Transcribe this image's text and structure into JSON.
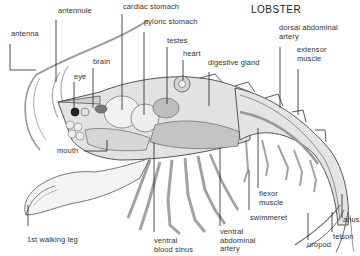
{
  "title": "LOBSTER",
  "colors": {
    "ink": "#333333",
    "shell_fill": "#dcdcdc",
    "organ_fill": "#c8c8c8",
    "background": "#ffffff"
  },
  "labels": {
    "antennule": "antennule",
    "antenna": "antenna",
    "cardiac_stomach": "cardiac stomach",
    "pyloric_stomach": "pyloric stomach",
    "testes": "testes",
    "heart": "heart",
    "brain": "brain",
    "eye": "eye",
    "digestive_gland": "digestive gland",
    "dorsal_abdominal_artery": "dorsal abdominal\nartery",
    "extensor_muscle": "extensor\nmuscle",
    "mouth": "mouth",
    "first_walking_leg": "1st walking leg",
    "ventral_blood_sinus": "ventral\nblood sinus",
    "ventral_abdominal_artery": "ventral\nabdominal\nartery",
    "swimmeret": "swimmeret",
    "flexor_muscle": "flexor\nmuscle",
    "uropod": "uropod",
    "telson": "telson",
    "anus": "anus"
  }
}
